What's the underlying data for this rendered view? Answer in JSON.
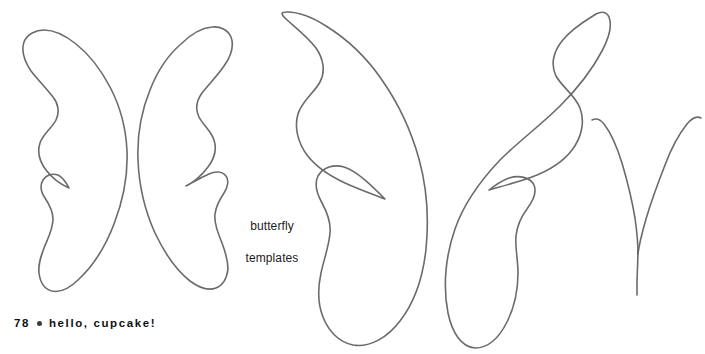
{
  "page": {
    "width": 705,
    "height": 354,
    "background_color": "#ffffff",
    "stroke_color": "#6b6b6b",
    "stroke_width": 1.6
  },
  "caption": {
    "text": "butterfly\ntemplates",
    "line1": "butterfly",
    "line2": "templates",
    "color": "#1c1c1c"
  },
  "footer": {
    "page_number": "78",
    "bullet": "●",
    "book_title": "hello, cupcake!",
    "color": "#111111"
  },
  "top_cut_text": {
    "text": "",
    "color": "#d8d8dd"
  },
  "shapes": [
    {
      "id": "wing-small-left",
      "name": "small-left-butterfly-wing",
      "label": "small left wing template",
      "bbox": [
        20,
        28,
        125,
        290
      ]
    },
    {
      "id": "wing-small-right",
      "name": "small-right-butterfly-wing",
      "label": "small right wing template",
      "bbox": [
        135,
        32,
        250,
        295
      ]
    },
    {
      "id": "wing-large-left",
      "name": "large-left-butterfly-wing",
      "label": "large left wing template",
      "bbox": [
        278,
        12,
        430,
        345
      ]
    },
    {
      "id": "wing-large-right",
      "name": "large-right-butterfly-wing",
      "label": "large right wing template",
      "bbox": [
        438,
        14,
        612,
        348
      ]
    },
    {
      "id": "antennae",
      "name": "antennae-template",
      "label": "antennae template",
      "bbox": [
        590,
        118,
        702,
        296
      ]
    }
  ]
}
